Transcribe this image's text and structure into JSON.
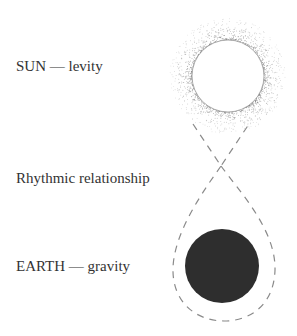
{
  "labels": {
    "sun": "SUN — levity",
    "relationship": "Rhythmic relationship",
    "earth": "EARTH — gravity"
  },
  "colors": {
    "earth_fill": "#2e2e2e",
    "dash_stroke": "#8a8a8a",
    "stipple": "#777777",
    "text": "#333333"
  }
}
